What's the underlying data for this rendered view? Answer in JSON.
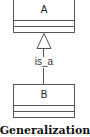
{
  "diagram": {
    "type": "uml-class-generalization",
    "classes": [
      {
        "id": "A",
        "name": "A",
        "compartments": 2
      },
      {
        "id": "B",
        "name": "B",
        "compartments": 2
      }
    ],
    "relationship": {
      "from": "B",
      "to": "A",
      "kind": "generalization",
      "label": "is_a",
      "arrowhead": "hollow-triangle"
    },
    "caption": "Generalization",
    "colors": {
      "line": "#555555",
      "background": "#ffffff",
      "text": "#222222"
    }
  }
}
